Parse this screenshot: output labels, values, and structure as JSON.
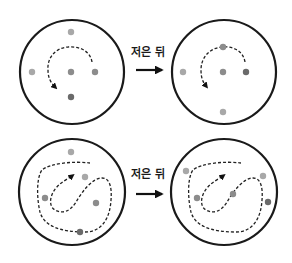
{
  "diagram": {
    "step_label": "저은 뒤",
    "colors": {
      "ring": "#1a1a1a",
      "dot_light": "#a8a8a8",
      "dot_mid": "#8c8c8c",
      "dot_dark": "#6a6a6a"
    },
    "rows": [
      {
        "name": "circular-stirring",
        "transition_label": "저은 뒤",
        "before": {
          "dots": [
            {
              "tone": "dot_light"
            },
            {
              "tone": "dot_light"
            },
            {
              "tone": "dot_mid"
            },
            {
              "tone": "dot_mid"
            },
            {
              "tone": "dot_dark"
            }
          ]
        },
        "after": {
          "dots": [
            {
              "tone": "dot_mid"
            },
            {
              "tone": "dot_light"
            },
            {
              "tone": "dot_mid"
            },
            {
              "tone": "dot_dark"
            },
            {
              "tone": "dot_light"
            }
          ]
        }
      },
      {
        "name": "chaotic-stirring",
        "transition_label": "저은 뒤",
        "before": {
          "dots": [
            {
              "tone": "dot_light"
            },
            {
              "tone": "dot_light"
            },
            {
              "tone": "dot_mid"
            },
            {
              "tone": "dot_mid"
            },
            {
              "tone": "dot_dark"
            }
          ]
        },
        "after": {
          "dots": [
            {
              "tone": "dot_light"
            },
            {
              "tone": "dot_light"
            },
            {
              "tone": "dot_mid"
            },
            {
              "tone": "dot_mid"
            },
            {
              "tone": "dot_dark"
            }
          ]
        }
      }
    ]
  }
}
